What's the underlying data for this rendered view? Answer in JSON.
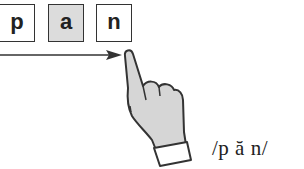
{
  "letters": [
    {
      "char": "p",
      "shaded": false
    },
    {
      "char": "a",
      "shaded": true
    },
    {
      "char": "n",
      "shaded": false
    }
  ],
  "pronunciation": "/p ă n/",
  "icons": {
    "arrow": "right-arrow-icon",
    "hand": "pointing-hand-icon"
  },
  "colors": {
    "outline": "#333333",
    "shaded_box": "#dcdcdc",
    "hand_fill": "#d6d6d6"
  }
}
